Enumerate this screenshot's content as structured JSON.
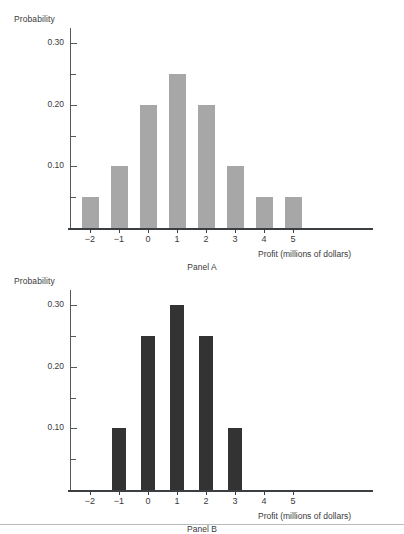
{
  "figure": {
    "panels": [
      {
        "id": "panel-a",
        "caption": "Panel A",
        "bar_color": "#a7a7a7",
        "y_title": "Probability",
        "x_title": "Profit (millions of dollars)",
        "y_labels": [
          "0.30",
          "0.20",
          "0.10"
        ],
        "x_labels": [
          "−2",
          "−1",
          "0",
          "1",
          "2",
          "3",
          "4",
          "5"
        ]
      },
      {
        "id": "panel-b",
        "caption": "Panel B",
        "bar_color": "#333334",
        "y_title": "Probability",
        "x_title": "Profit (millions of dollars)",
        "y_labels": [
          "0.30",
          "0.20",
          "0.10"
        ],
        "x_labels": [
          "−2",
          "−1",
          "0",
          "1",
          "2",
          "3",
          "4",
          "5"
        ]
      }
    ]
  },
  "chart_data": [
    {
      "type": "bar",
      "title": "Panel A",
      "xlabel": "Profit (millions of dollars)",
      "ylabel": "Probability",
      "categories": [
        -2,
        -1,
        0,
        1,
        2,
        3,
        4,
        5
      ],
      "tick_labels": [
        "−2",
        "−1",
        "0",
        "1",
        "2",
        "3",
        "4",
        "5"
      ],
      "values": [
        0.05,
        0.1,
        0.2,
        0.25,
        0.2,
        0.1,
        0.05,
        0.05
      ],
      "ylim": [
        0,
        0.325
      ],
      "xlim": [
        -2.8,
        6.6
      ],
      "y_major_ticks": [
        0.1,
        0.2,
        0.3
      ],
      "y_major_tick_labels": [
        "0.10",
        "0.20",
        "0.30"
      ],
      "y_minor_ticks": [
        0.05,
        0.15,
        0.25
      ],
      "bar_color": "#a7a7a7",
      "grid": false,
      "legend": false
    },
    {
      "type": "bar",
      "title": "Panel B",
      "xlabel": "Profit (millions of dollars)",
      "ylabel": "Probability",
      "categories": [
        -2,
        -1,
        0,
        1,
        2,
        3,
        4,
        5
      ],
      "tick_labels": [
        "−2",
        "−1",
        "0",
        "1",
        "2",
        "3",
        "4",
        "5"
      ],
      "values": [
        0,
        0.1,
        0.25,
        0.3,
        0.25,
        0.1,
        0,
        0
      ],
      "ylim": [
        0,
        0.325
      ],
      "xlim": [
        -2.8,
        6.6
      ],
      "y_major_ticks": [
        0.1,
        0.2,
        0.3
      ],
      "y_major_tick_labels": [
        "0.10",
        "0.20",
        "0.30"
      ],
      "y_minor_ticks": [
        0.05,
        0.15,
        0.25
      ],
      "bar_color": "#333334",
      "grid": false,
      "legend": false
    }
  ]
}
